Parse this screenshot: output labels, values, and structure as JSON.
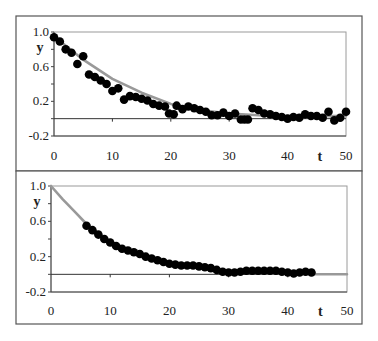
{
  "chart_data": [
    {
      "type": "scatter",
      "title": "",
      "xlabel": "t",
      "ylabel": "y",
      "xlim": [
        0,
        50
      ],
      "ylim": [
        -0.2,
        1.0
      ],
      "xticks": [
        "0",
        "10",
        "20",
        "30",
        "40",
        "50"
      ],
      "yticks": [
        "1.0",
        "0.6",
        "0.2",
        "-0.2"
      ],
      "grid": false,
      "reference_line_y": 0,
      "series": [
        {
          "name": "observed",
          "kind": "points",
          "x": [
            0,
            1,
            2,
            3,
            4,
            5,
            6,
            7,
            8,
            9,
            10,
            11,
            12,
            13,
            14,
            15,
            16,
            17,
            18,
            19,
            19.7,
            20.5,
            21,
            22,
            23,
            24,
            25,
            26,
            27,
            28,
            29,
            30,
            31,
            32,
            32.6,
            33.2,
            34,
            35,
            36,
            37,
            38,
            39,
            40,
            41,
            42,
            43,
            44,
            45,
            46,
            47,
            48,
            49,
            50
          ],
          "y": [
            0.94,
            0.89,
            0.8,
            0.76,
            0.63,
            0.72,
            0.51,
            0.48,
            0.44,
            0.4,
            0.32,
            0.35,
            0.22,
            0.26,
            0.25,
            0.23,
            0.21,
            0.17,
            0.15,
            0.14,
            0.06,
            0.05,
            0.15,
            0.11,
            0.14,
            0.12,
            0.1,
            0.08,
            0.04,
            0.04,
            0.07,
            0.03,
            0.06,
            -0.01,
            -0.01,
            -0.01,
            0.12,
            0.1,
            0.06,
            0.05,
            0.03,
            0.02,
            0.0,
            0.02,
            0.01,
            0.05,
            0.03,
            0.03,
            0.01,
            0.08,
            -0.02,
            0.01,
            0.08
          ]
        },
        {
          "name": "fit",
          "kind": "line",
          "x": [
            0,
            5,
            10,
            15,
            20,
            25,
            30,
            35,
            40,
            45,
            50
          ],
          "y": [
            0.95,
            0.68,
            0.46,
            0.3,
            0.17,
            0.1,
            0.06,
            0.04,
            0.03,
            0.03,
            0.03
          ]
        }
      ]
    },
    {
      "type": "scatter",
      "title": "",
      "xlabel": "t",
      "ylabel": "y",
      "xlim": [
        0,
        50
      ],
      "ylim": [
        -0.2,
        1.0
      ],
      "xticks": [
        "0",
        "10",
        "20",
        "30",
        "40",
        "50"
      ],
      "yticks": [
        "1.0",
        "0.6",
        "0.2",
        "-0.2"
      ],
      "grid": false,
      "reference_line_y": 0,
      "series": [
        {
          "name": "smoothed",
          "kind": "points",
          "x": [
            6,
            7,
            8,
            9,
            10,
            11,
            12,
            13,
            14,
            15,
            16,
            17,
            18,
            19,
            20,
            21,
            22,
            23,
            24,
            25,
            26,
            27,
            28,
            29,
            30,
            31,
            32,
            33,
            34,
            35,
            36,
            37,
            38,
            39,
            40,
            41,
            42,
            43,
            44
          ],
          "y": [
            0.55,
            0.5,
            0.45,
            0.4,
            0.36,
            0.32,
            0.29,
            0.27,
            0.25,
            0.23,
            0.2,
            0.18,
            0.16,
            0.14,
            0.12,
            0.11,
            0.1,
            0.1,
            0.1,
            0.09,
            0.08,
            0.07,
            0.05,
            0.03,
            0.02,
            0.02,
            0.03,
            0.04,
            0.04,
            0.04,
            0.04,
            0.04,
            0.04,
            0.03,
            0.02,
            0.01,
            0.02,
            0.03,
            0.02
          ]
        },
        {
          "name": "fit",
          "kind": "line",
          "x": [
            0,
            2,
            4,
            6,
            8,
            10,
            15,
            20,
            25,
            30,
            35,
            40,
            45,
            50
          ],
          "y": [
            1.0,
            0.85,
            0.71,
            0.57,
            0.46,
            0.37,
            0.22,
            0.12,
            0.08,
            0.02,
            0.02,
            0.01,
            0.0,
            0.0
          ]
        }
      ]
    }
  ]
}
